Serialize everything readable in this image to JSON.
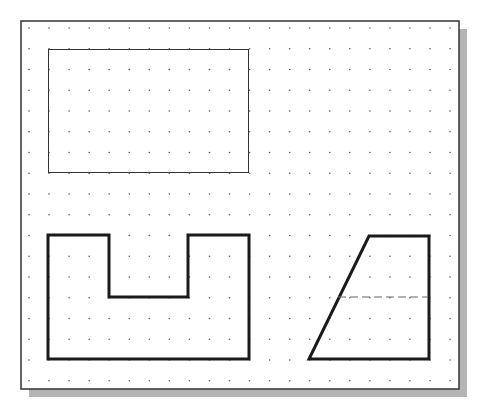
{
  "canvas": {
    "background": "#ffffff",
    "frame": {
      "x": 21,
      "y": 21,
      "width": 438,
      "height": 368,
      "stroke": "#333333",
      "stroke_width": 1.5
    },
    "shadow": {
      "offset": 8,
      "color": "#b4b4b4"
    },
    "grid": {
      "dot_color": "#555555",
      "dot_radius": 0.8,
      "x_start": 29,
      "x_step": 20.05,
      "x_count": 22,
      "y_start": 28,
      "y_step": 20.75,
      "y_count": 18
    }
  },
  "shapes": [
    {
      "name": "thin-rectangle",
      "type": "rect",
      "x": 48.5,
      "y": 49.5,
      "width": 200,
      "height": 123,
      "stroke": "#333333",
      "stroke_width": 1
    },
    {
      "name": "u-shape-outline",
      "type": "polygon",
      "points": [
        [
          48,
          235
        ],
        [
          109,
          235
        ],
        [
          109,
          297
        ],
        [
          188,
          297
        ],
        [
          188,
          235
        ],
        [
          249,
          235
        ],
        [
          249,
          359
        ],
        [
          48,
          359
        ]
      ],
      "stroke": "#1a1a1a",
      "stroke_width": 3
    },
    {
      "name": "trapezoid-outline",
      "type": "polygon",
      "points": [
        [
          369,
          236
        ],
        [
          429,
          236
        ],
        [
          429,
          359
        ],
        [
          309,
          359
        ]
      ],
      "stroke": "#1a1a1a",
      "stroke_width": 3
    },
    {
      "name": "hidden-line",
      "type": "line",
      "x1": 338,
      "y1": 297,
      "x2": 428,
      "y2": 297,
      "stroke": "#666666",
      "stroke_width": 1.2,
      "dash": "8 4"
    }
  ]
}
